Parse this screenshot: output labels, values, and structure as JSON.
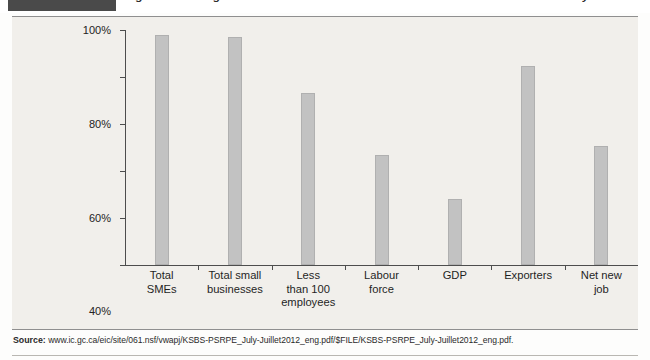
{
  "header": {
    "figure_tag": "",
    "title": "gure 1: The Signi cant Contributions of Small Business to the Canadian Economy"
  },
  "source": {
    "label": "Source:",
    "url": "www.ic.gc.ca/eic/site/061.nsf/vwapj/KSBS-PSRPE_July-Juillet2012_eng.pdf/$FILE/KSBS-PSRPE_July-Juillet2012_eng.pdf."
  },
  "colors": {
    "bar_fill": "#c2c2c2",
    "bar_stroke": "#b0b0b0",
    "panel_background": "#f1efeb",
    "axis": "#4d4d4d",
    "figure_tag": "#4a4a4a"
  },
  "chart_data": {
    "type": "bar",
    "xlabel": "",
    "ylabel": "",
    "ylim": [
      0,
      100
    ],
    "yticks": [
      0,
      20,
      40,
      60,
      80,
      100
    ],
    "ytick_labels": [
      "0%",
      "20%",
      "40%",
      "60%",
      "80%",
      "100%"
    ],
    "grid": false,
    "legend": "none",
    "categories": [
      "Total SMEs",
      "Total small businesses",
      "Less than 100 employees",
      "Labour force",
      "GDP",
      "Exporters",
      "Net new job"
    ],
    "category_lines": [
      [
        "Total",
        "SMEs"
      ],
      [
        "Total small",
        "businesses"
      ],
      [
        "Less",
        "than 100",
        "employees"
      ],
      [
        "Labour",
        "force"
      ],
      [
        "GDP"
      ],
      [
        "Exporters"
      ],
      [
        "Net new",
        "job"
      ]
    ],
    "values": [
      98,
      97,
      73,
      46.5,
      28,
      84.5,
      50.5
    ]
  }
}
